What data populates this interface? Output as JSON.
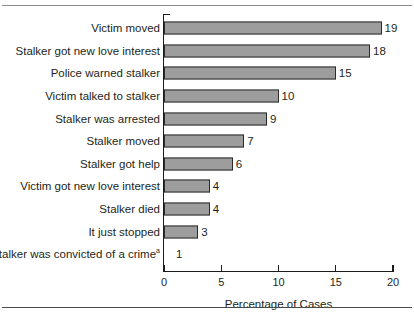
{
  "figure": {
    "cropped_title_fragment": "",
    "x_axis_title": "Percentage of Cases",
    "footnote_marker": "a"
  },
  "chart_data": {
    "type": "bar",
    "orientation": "horizontal",
    "title": "",
    "xlabel": "Percentage of Cases",
    "ylabel": "",
    "xlim": [
      0,
      20
    ],
    "xticks": [
      0,
      5,
      10,
      15,
      20
    ],
    "xtick_labels": [
      "0",
      "5",
      "10",
      "15",
      "20"
    ],
    "grid": false,
    "legend": null,
    "bar_color": "#9d9d9d",
    "bar_border_color": "#2b2b2b",
    "axis_color": "#1b1b1b",
    "categories": [
      "Victim moved",
      "Stalker got new love interest",
      "Police warned stalker",
      "Victim talked to stalker",
      "Stalker was arrested",
      "Stalker moved",
      "Stalker got help",
      "Victim got new love interest",
      "Stalker died",
      "It just stopped",
      "Stalker was convicted of a crime"
    ],
    "values": [
      19,
      18,
      15,
      10,
      9,
      7,
      6,
      4,
      4,
      3,
      1
    ],
    "value_labels": [
      "19",
      "18",
      "15",
      "10",
      "9",
      "7",
      "6",
      "4",
      "4",
      "3",
      "1"
    ],
    "bars": [
      {
        "label": "Victim moved",
        "value": 19,
        "value_label": "19",
        "has_bar": true
      },
      {
        "label": "Stalker got new love interest",
        "value": 18,
        "value_label": "18",
        "has_bar": true
      },
      {
        "label": "Police warned stalker",
        "value": 15,
        "value_label": "15",
        "has_bar": true
      },
      {
        "label": "Victim talked to stalker",
        "value": 10,
        "value_label": "10",
        "has_bar": true
      },
      {
        "label": "Stalker was arrested",
        "value": 9,
        "value_label": "9",
        "has_bar": true
      },
      {
        "label": "Stalker moved",
        "value": 7,
        "value_label": "7",
        "has_bar": true
      },
      {
        "label": "Stalker got help",
        "value": 6,
        "value_label": "6",
        "has_bar": true
      },
      {
        "label": "Victim got new love interest",
        "value": 4,
        "value_label": "4",
        "has_bar": true
      },
      {
        "label": "Stalker died",
        "value": 4,
        "value_label": "4",
        "has_bar": true
      },
      {
        "label": "It just stopped",
        "value": 3,
        "value_label": "3",
        "has_bar": true
      },
      {
        "label": "Stalker was convicted of a crime",
        "value": 1,
        "value_label": "1",
        "has_bar": false,
        "footnote": "a"
      }
    ]
  }
}
